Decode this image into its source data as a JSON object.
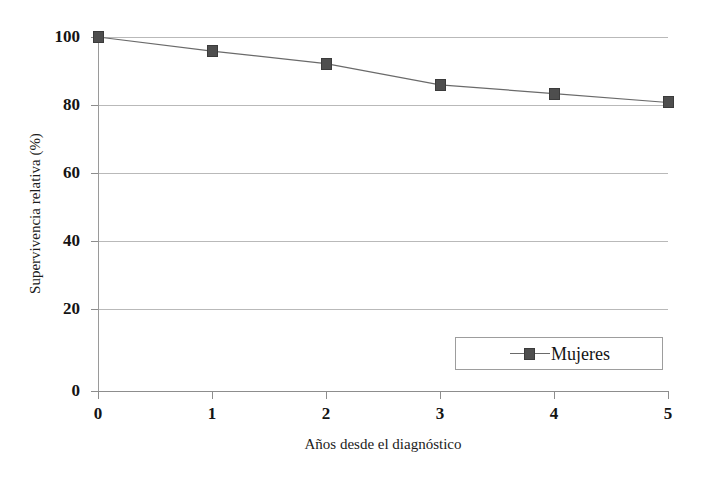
{
  "chart_data": {
    "type": "line",
    "title": "",
    "xlabel": "Años desde el diagnóstico",
    "ylabel": "Supervivencia relativa (%)",
    "x": [
      0,
      1,
      2,
      3,
      4,
      5
    ],
    "xtick_labels": [
      "0",
      "1",
      "2",
      "3",
      "4",
      "5"
    ],
    "ytick_labels": [
      "0",
      "20",
      "40",
      "60",
      "80",
      "100"
    ],
    "yticks": [
      0,
      20,
      40,
      60,
      80,
      100
    ],
    "ylim": [
      0,
      100
    ],
    "xlim": [
      0,
      5
    ],
    "grid": "horizontal",
    "legend_position": "inside-lower-right",
    "series": [
      {
        "name": "Mujeres",
        "marker": "square",
        "marker_color": "#4e4e4e",
        "line_color": "#6a6a6a",
        "values": [
          100,
          96,
          92.5,
          86.5,
          84,
          81.5
        ]
      }
    ]
  },
  "legend": {
    "entries": [
      {
        "label": "Mujeres",
        "swatch_name": "square-marker-swatch"
      }
    ]
  },
  "axis": {
    "y_title": "Supervivencia relativa (%)",
    "x_title": "Años desde el diagnóstico"
  },
  "colors": {
    "marker": "#4e4e4e",
    "line": "#6a6a6a",
    "gridline": "#b9b9b9",
    "axis": "#8d8d8d",
    "text": "#141414",
    "background": "#ffffff"
  }
}
